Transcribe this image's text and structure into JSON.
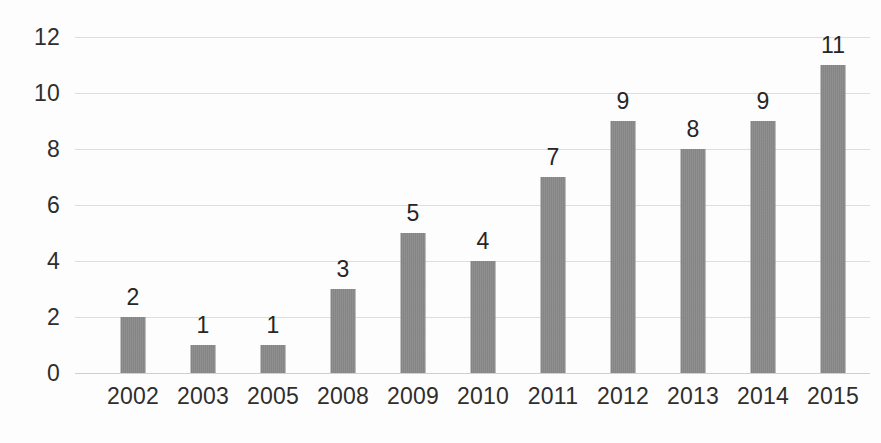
{
  "chart_data": {
    "type": "bar",
    "title": "",
    "subtitle": "",
    "xlabel": "",
    "ylabel": "",
    "categories": [
      "2002",
      "2003",
      "2005",
      "2008",
      "2009",
      "2010",
      "2011",
      "2012",
      "2013",
      "2014",
      "2015"
    ],
    "values": [
      2,
      1,
      1,
      3,
      5,
      4,
      7,
      9,
      8,
      9,
      11
    ],
    "data_labels": [
      "2",
      "1",
      "1",
      "3",
      "5",
      "4",
      "7",
      "9",
      "8",
      "9",
      "11"
    ],
    "ylim": [
      0,
      12
    ],
    "y_ticks": [
      0,
      2,
      4,
      6,
      8,
      10,
      12
    ],
    "y_tick_labels": [
      "0",
      "2",
      "4",
      "6",
      "8",
      "10",
      "12"
    ],
    "grid": true,
    "grid_axis": "y",
    "legend": false,
    "legend_position": "none",
    "annotations": [],
    "colors": {
      "bar_fill": "#8a8a8a",
      "gridline": "#d8d8d8",
      "axis_text": "#2e2e2e",
      "data_label_text": "#262626",
      "background": "#fdfdfd"
    }
  }
}
